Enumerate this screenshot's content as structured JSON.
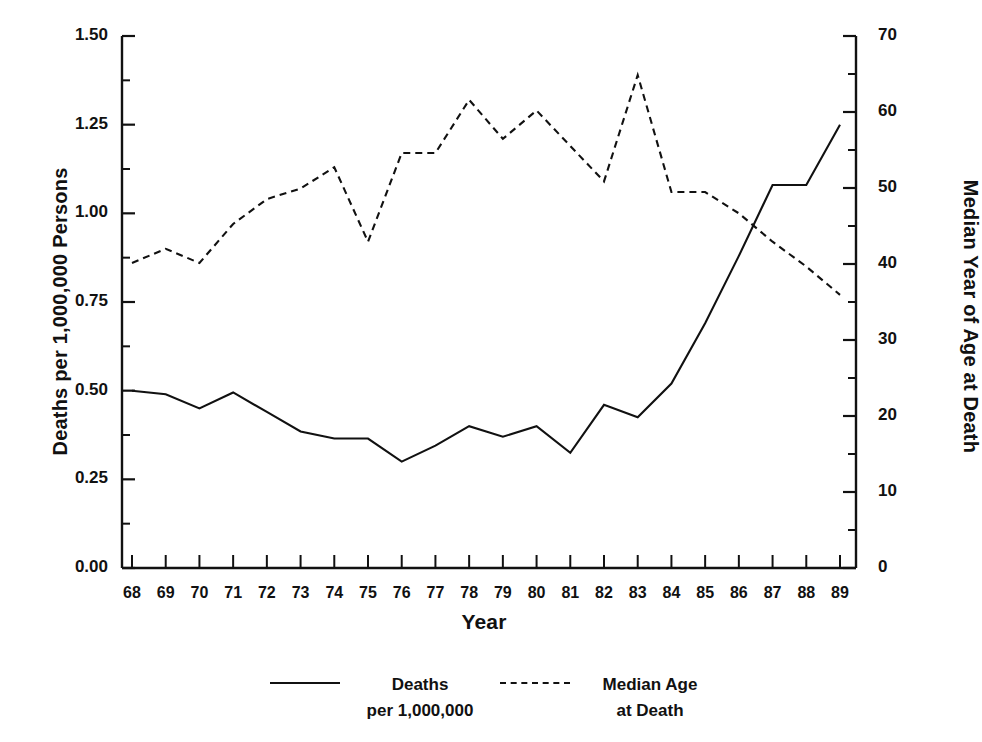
{
  "chart_data": {
    "type": "line",
    "title": "",
    "xlabel": "Year",
    "ylabel": "Deaths per 1,000,000 Persons",
    "ylabel_right": "Median Year of Age at Death",
    "categories": [
      "68",
      "69",
      "70",
      "71",
      "72",
      "73",
      "74",
      "75",
      "76",
      "77",
      "78",
      "79",
      "80",
      "81",
      "82",
      "83",
      "84",
      "85",
      "86",
      "87",
      "88",
      "89"
    ],
    "xlim": [
      0,
      21
    ],
    "ylim": [
      0.0,
      1.5
    ],
    "ylim_right": [
      0,
      70
    ],
    "yticks": [
      "0.00",
      "0.25",
      "0.50",
      "0.75",
      "1.00",
      "1.25",
      "1.50"
    ],
    "yticks_right": [
      "0",
      "10",
      "20",
      "30",
      "40",
      "50",
      "60",
      "70"
    ],
    "grid": false,
    "legend_position": "bottom",
    "series": [
      {
        "name": "Deaths per 1,000,000",
        "axis": "left",
        "style": "solid",
        "color": "#111111",
        "values": [
          0.5,
          0.49,
          0.45,
          0.495,
          0.44,
          0.385,
          0.365,
          0.365,
          0.3,
          0.345,
          0.4,
          0.37,
          0.4,
          0.325,
          0.46,
          0.425,
          0.52,
          0.69,
          0.88,
          1.08,
          1.08,
          1.25
        ]
      },
      {
        "name": "Median Age at Death",
        "axis": "right",
        "style": "dashed",
        "color": "#111111",
        "values_left_scale": [
          0.86,
          0.9,
          0.86,
          0.97,
          1.04,
          1.07,
          1.13,
          0.92,
          1.17,
          1.17,
          1.32,
          1.21,
          1.29,
          1.19,
          1.09,
          1.39,
          1.06,
          1.06,
          1.0,
          0.92,
          0.85,
          0.77
        ],
        "values": [
          40.1,
          42.0,
          40.1,
          45.3,
          48.5,
          49.9,
          52.7,
          42.9,
          54.6,
          54.6,
          61.6,
          56.5,
          60.2,
          55.5,
          50.9,
          64.9,
          49.5,
          49.5,
          46.7,
          42.9,
          39.7,
          35.9
        ]
      }
    ]
  },
  "legend": {
    "deaths": {
      "label": "Deaths\nper 1,000,000",
      "marker": "solid-line-icon"
    },
    "median_age": {
      "label": "Median Age\nat Death",
      "marker": "dashed-line-icon"
    }
  },
  "axes": {
    "left_title": "Deaths per 1,000,000 Persons",
    "right_title": "Median Year of Age at Death",
    "bottom_title": "Year"
  }
}
